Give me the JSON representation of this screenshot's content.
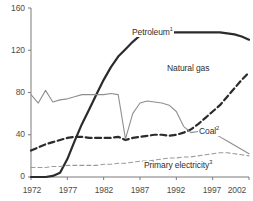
{
  "chart_data": {
    "type": "line",
    "title": "",
    "subtitle": "",
    "xlabel": "",
    "ylabel": "",
    "xlim": [
      1972,
      2002
    ],
    "ylim": [
      0,
      160
    ],
    "grid": false,
    "legend_position": "inline-labels",
    "x_ticks": [
      "1972",
      "1977",
      "1982",
      "1987",
      "1992",
      "1997",
      "2002"
    ],
    "y_ticks": [
      "0",
      "40",
      "80",
      "120",
      "160"
    ],
    "x": [
      1972,
      1973,
      1974,
      1975,
      1976,
      1977,
      1978,
      1979,
      1980,
      1981,
      1982,
      1983,
      1984,
      1985,
      1986,
      1987,
      1988,
      1989,
      1990,
      1991,
      1992,
      1993,
      1994,
      1995,
      1996,
      1997,
      1998,
      1999,
      2000,
      2001,
      2002
    ],
    "series": [
      {
        "name": "Petroleum",
        "label": "Petroleum",
        "footnote": "1",
        "color": "#2b2b2b",
        "style": "solid-thick",
        "values": [
          0,
          0,
          0,
          1,
          4,
          17,
          34,
          50,
          64,
          78,
          92,
          104,
          114,
          121,
          128,
          134,
          137,
          138,
          138,
          137,
          137,
          137,
          137,
          137,
          137,
          137,
          137,
          136,
          135,
          133,
          130
        ]
      },
      {
        "name": "Natural gas",
        "label": "Natural gas",
        "footnote": "",
        "color": "#2b2b2b",
        "style": "dashed-thick",
        "values": [
          25,
          28,
          31,
          33,
          35,
          37,
          38,
          38,
          37,
          37,
          37,
          37,
          38,
          35,
          37,
          38,
          39,
          40,
          40,
          39,
          40,
          42,
          45,
          50,
          56,
          62,
          68,
          76,
          84,
          92,
          99
        ]
      },
      {
        "name": "Coal",
        "label": "Coal",
        "footnote": "2",
        "color": "#8f8f8f",
        "style": "solid-thin",
        "values": [
          78,
          70,
          82,
          71,
          73,
          74,
          76,
          78,
          78,
          78,
          78,
          79,
          78,
          36,
          60,
          70,
          72,
          71,
          70,
          68,
          62,
          48,
          42,
          43,
          44,
          42,
          38,
          34,
          30,
          26,
          22
        ]
      },
      {
        "name": "Primary electricity",
        "label": "Primary electricity",
        "footnote": "3",
        "color": "#9a9a9a",
        "style": "dashed-thin",
        "values": [
          9,
          9,
          9,
          10,
          10,
          11,
          11,
          11,
          11,
          11,
          12,
          12,
          13,
          13,
          14,
          15,
          15,
          16,
          17,
          18,
          18,
          19,
          19,
          20,
          21,
          22,
          23,
          23,
          22,
          21,
          20
        ]
      }
    ],
    "axis_color": "#7a7a7a"
  },
  "labels": {
    "petroleum": "Petroleum",
    "petroleum_note": "1",
    "natural_gas": "Natural gas",
    "coal": "Coal",
    "coal_note": "2",
    "primary_electricity": "Primary electricity",
    "primary_electricity_note": "3"
  }
}
